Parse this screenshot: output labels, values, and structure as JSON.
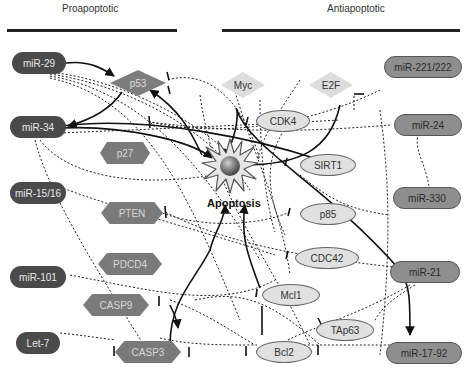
{
  "headers": {
    "left": "Proapoptotic",
    "right": "Antiapoptotic"
  },
  "center": {
    "label": "Apoptosis"
  },
  "nodes": {
    "mir29": "miR-29",
    "mir34": "miR-34",
    "mir1516": "miR-15/16",
    "mir101": "miR-101",
    "let7": "Let-7",
    "mir221": "miR-221/222",
    "mir24": "miR-24",
    "mir330": "miR-330",
    "mir21": "miR-21",
    "mir1792": "miR-17-92",
    "p53": "p53",
    "myc": "Myc",
    "e2f": "E2F",
    "cdk4": "CDK4",
    "p27": "p27",
    "sirt1": "SIRT1",
    "pten": "PTEN",
    "p85": "p85",
    "pdcd4": "PDCD4",
    "cdc42": "CDC42",
    "casp9": "CASP9",
    "mcl1": "Mcl1",
    "tap63": "TAp63",
    "casp3": "CASP3",
    "bcl2": "Bcl2"
  },
  "colors": {
    "dark_mirna": "#4a4a4a",
    "gray_mirna": "#8e8e8e",
    "hexagon": "#7a7a7a",
    "p53_diamond": "#7d7d7d",
    "light_diamond": "#dcdcdc",
    "oval": "#e0e0e0"
  }
}
